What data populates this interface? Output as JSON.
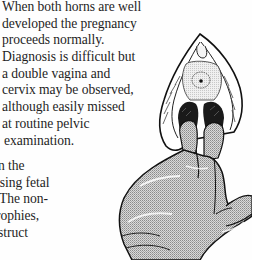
{
  "document": {
    "type": "scanned textbook page",
    "upper_paragraph": {
      "lines": [
        "When both horns are well",
        "developed the pregnancy",
        "proceeds normally.",
        "Diagnosis is difficult but",
        "a double vagina and",
        "cervix may be observed,",
        "although easily missed",
        "at routine pelvic",
        "examination."
      ]
    },
    "lower_paragraph_cropped": {
      "lines": [
        "n the",
        "using fetal",
        "The non-",
        "rophies,",
        "struct"
      ]
    },
    "figure": {
      "description": "Line illustration of a gloved hand performing a pelvic examination with two fingers inserted, showing a double vagina and single external cervical os",
      "elements": [
        "gloved-hand",
        "double-vaginal-openings",
        "cervix",
        "labia-outline"
      ]
    }
  }
}
